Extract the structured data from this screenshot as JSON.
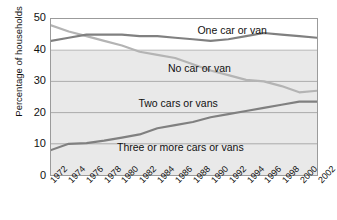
{
  "chart_data": {
    "type": "line",
    "title": "",
    "xlabel": "",
    "ylabel": "Percentage of households",
    "ylim": [
      0,
      50
    ],
    "yticks": [
      0,
      10,
      20,
      30,
      40,
      50
    ],
    "grid": true,
    "legend_position": "in-plot-labels",
    "x": [
      1972,
      1974,
      1976,
      1978,
      1980,
      1982,
      1984,
      1986,
      1988,
      1990,
      1992,
      1994,
      1996,
      1998,
      2000,
      2002
    ],
    "xtick_labels": [
      "1972",
      "1974",
      "1976",
      "1978",
      "1980",
      "1982",
      "1984",
      "1986",
      "1988",
      "1990",
      "1992",
      "1994",
      "1996",
      "1998",
      "2000",
      "2002"
    ],
    "series": [
      {
        "name": "No car or van",
        "color": "#b4b4b4",
        "values": [
          48.0,
          46.0,
          44.5,
          43.0,
          41.5,
          39.5,
          38.5,
          37.5,
          35.5,
          33.5,
          32.0,
          30.5,
          30.0,
          28.5,
          26.5,
          27.0
        ]
      },
      {
        "name": "One car or van",
        "color": "#808080",
        "values": [
          43.0,
          44.0,
          45.0,
          45.0,
          45.0,
          44.5,
          44.5,
          44.0,
          43.5,
          43.0,
          43.5,
          44.5,
          45.5,
          45.0,
          44.5,
          44.0
        ]
      },
      {
        "name": "Two cars or vans",
        "color": "#808080",
        "values": [
          8.0,
          10.0,
          10.2,
          11.0,
          12.0,
          13.0,
          15.0,
          16.0,
          17.0,
          18.5,
          19.5,
          20.5,
          21.5,
          22.5,
          23.5,
          23.5
        ]
      }
    ],
    "series_labels": [
      {
        "text": "One car or van",
        "x_pct": 55,
        "y_pct": 4
      },
      {
        "text": "No car or van",
        "x_pct": 44,
        "y_pct": 28
      },
      {
        "text": "Two cars or vans",
        "x_pct": 33,
        "y_pct": 50
      },
      {
        "text": "Three or more cars or vans",
        "x_pct": 25,
        "y_pct": 78
      }
    ]
  }
}
